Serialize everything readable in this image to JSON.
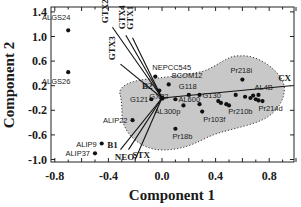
{
  "chart_data": {
    "type": "scatter",
    "subtype": "biplot",
    "title": "",
    "xlabel": "Component 1",
    "ylabel": "Component 2",
    "xlim": [
      -0.8,
      1.0
    ],
    "ylim": [
      -1.0,
      1.4
    ],
    "xticks": [
      -0.8,
      -0.4,
      0.0,
      0.4,
      0.8
    ],
    "xtick_labels": [
      "-0.8",
      "-0.4",
      "0.0",
      "0.4",
      "0.8"
    ],
    "yticks": [
      1.4,
      1.0,
      0.6,
      0.2,
      -0.2,
      -0.6,
      -1.0
    ],
    "ytick_labels": [
      "1.4",
      "1.0",
      "0.6",
      "0.2",
      "-0.2",
      "-0.6",
      "-1.0"
    ],
    "grid": false,
    "legend": null,
    "points": [
      {
        "label": "ALGS24",
        "x": -0.7,
        "y": 1.1
      },
      {
        "label": "ALGS26",
        "x": -0.7,
        "y": 0.42
      },
      {
        "label": "NEPCC545",
        "x": -0.05,
        "y": 0.35
      },
      {
        "label": "BCOM12",
        "x": 0.05,
        "y": 0.22
      },
      {
        "label": "GX22",
        "x": -0.02,
        "y": 0.12
      },
      {
        "label": "G118",
        "x": 0.2,
        "y": 0.05
      },
      {
        "label": "Pr218i",
        "x": 0.6,
        "y": 0.3
      },
      {
        "label": "G121",
        "x": -0.08,
        "y": -0.02
      },
      {
        "label": "AL600",
        "x": 0.1,
        "y": -0.02
      },
      {
        "label": "G130",
        "x": 0.28,
        "y": 0.05
      },
      {
        "label": "AL300p",
        "x": 0.16,
        "y": -0.12
      },
      {
        "label": "Pr103f",
        "x": 0.3,
        "y": -0.22
      },
      {
        "label": "Pr210b",
        "x": 0.48,
        "y": -0.1
      },
      {
        "label": "Pr214d",
        "x": 0.75,
        "y": -0.05
      },
      {
        "label": "AL4B",
        "x": 0.72,
        "y": 0.05
      },
      {
        "label": "Pr18b",
        "x": 0.1,
        "y": -0.5
      },
      {
        "label": "ALIP22",
        "x": -0.22,
        "y": -0.36
      },
      {
        "label": "ALIP9",
        "x": -0.45,
        "y": -0.74
      },
      {
        "label": "ALIP37",
        "x": -0.5,
        "y": -0.9
      }
    ],
    "unlabeled_points": [
      {
        "x": 0.42,
        "y": -0.05
      },
      {
        "x": 0.44,
        "y": -0.08
      },
      {
        "x": 0.5,
        "y": -0.12
      },
      {
        "x": 0.55,
        "y": 0.05
      },
      {
        "x": 0.62,
        "y": 0.02
      },
      {
        "x": 0.66,
        "y": 0.0
      },
      {
        "x": 0.7,
        "y": -0.02
      },
      {
        "x": 0.68,
        "y": 0.04
      },
      {
        "x": 0.72,
        "y": -0.04
      },
      {
        "x": 0.28,
        "y": -0.1
      }
    ],
    "vectors": [
      {
        "label": "GTX2",
        "x": -0.37,
        "y": 1.15
      },
      {
        "label": "GTX4",
        "x": -0.27,
        "y": 1.02
      },
      {
        "label": "GTX1",
        "x": -0.22,
        "y": 0.98
      },
      {
        "label": "GTX3",
        "x": -0.31,
        "y": 0.55
      },
      {
        "label": "B2",
        "x": -0.05,
        "y": 0.22
      },
      {
        "label": "CX",
        "x": 0.96,
        "y": 0.2
      },
      {
        "label": "B1",
        "x": -0.31,
        "y": -0.84
      },
      {
        "label": "NEO",
        "x": -0.25,
        "y": -0.84
      },
      {
        "label": "STX",
        "x": -0.2,
        "y": -1.0
      }
    ],
    "shaded_region": "dotted-outline grey cluster covering G121, GX22, G118, Pr218i, AL4B, Pr214d, Pr210b, Pr103f, Pr18b, AL300p, AL600, G130"
  }
}
